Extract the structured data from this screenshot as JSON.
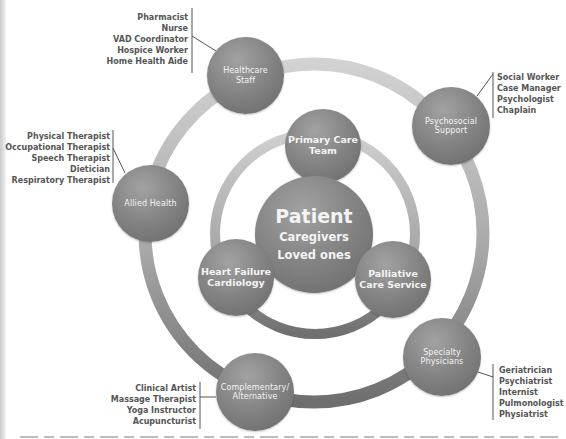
{
  "diagram": {
    "center": {
      "title": "Patient",
      "subtitle_lines": [
        "Caregivers",
        "Loved ones"
      ]
    },
    "inner_ring": [
      {
        "label_lines": [
          "Primary Care",
          "Team"
        ]
      },
      {
        "label_lines": [
          "Heart Failure",
          "Cardiology"
        ]
      },
      {
        "label_lines": [
          "Palliative",
          "Care Service"
        ]
      }
    ],
    "outer_ring": [
      {
        "label_lines": [
          "Healthcare",
          "Staff"
        ],
        "roles": [
          "Pharmacist",
          "Nurse",
          "VAD Coordinator",
          "Hospice Worker",
          "Home Health Aide"
        ]
      },
      {
        "label_lines": [
          "Psychosocial",
          "Support"
        ],
        "roles": [
          "Social Worker",
          "Case Manager",
          "Psychologist",
          "Chaplain"
        ]
      },
      {
        "label_lines": [
          "Allied Health"
        ],
        "roles": [
          "Physical Therapist",
          "Occupational Therapist",
          "Speech Therapist",
          "Dietician",
          "Respiratory Therapist"
        ]
      },
      {
        "label_lines": [
          "Specialty",
          "Physicians"
        ],
        "roles": [
          "Geriatrician",
          "Psychiatrist",
          "Internist",
          "Pulmonologist",
          "Physiatrist"
        ]
      },
      {
        "label_lines": [
          "Complementary/",
          "Alternative"
        ],
        "roles": [
          "Clinical Artist",
          "Massage Therapist",
          "Yoga Instructor",
          "Acupuncturist"
        ]
      }
    ],
    "colors": {
      "node_fill": "#858585",
      "ring_light": "#cfcfcf",
      "ring_dark": "#6e6e6e",
      "role_text": "#555555",
      "node_text": "#f4f4f4"
    }
  }
}
